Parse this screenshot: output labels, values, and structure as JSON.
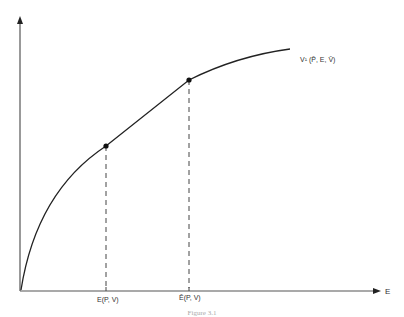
{
  "diagram": {
    "curve_label": "V¹ (P̄, E, V̄)",
    "x_axis_label": "E",
    "points": [
      {
        "label": "E(P, V)",
        "x": 106,
        "y": 146
      },
      {
        "label": "Ē(P, V)",
        "x": 189,
        "y": 80
      }
    ],
    "caption": "Figure 3.1",
    "colors": {
      "line": "#222222",
      "axis": "#333333",
      "dashed": "#444444"
    }
  }
}
